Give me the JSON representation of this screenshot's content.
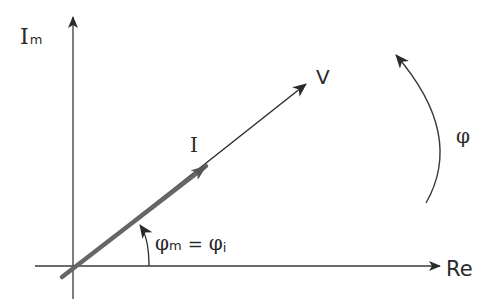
{
  "diagram": {
    "type": "phasor-diagram",
    "axes": {
      "imaginary_label_main": "I",
      "imaginary_label_sub": "m",
      "real_label": "Re"
    },
    "phasors": [
      {
        "name": "V",
        "label": "V",
        "style": "thin"
      },
      {
        "name": "I",
        "label": "I",
        "style": "thick"
      }
    ],
    "angle_label": {
      "phi": "φ",
      "m_sub": "m",
      "equals": "=",
      "i_sub": "i"
    },
    "rotation_label": "φ",
    "colors": {
      "axis": "#3a3a3a",
      "voltage": "#2a2a2a",
      "current": "#6e6e6e",
      "text": "#2a2a2a"
    }
  }
}
